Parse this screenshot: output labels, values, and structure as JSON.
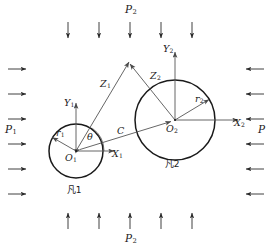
{
  "figure": {
    "type": "engineering-diagram",
    "stroke_color": "#1a1a1a",
    "thin_color": "#555555",
    "background": "#ffffff"
  },
  "loads": {
    "top_label": "P",
    "top_sub": "2",
    "bottom_label": "P",
    "bottom_sub": "2",
    "left_label": "P",
    "left_sub": "1",
    "right_label": "P",
    "right_sub": "",
    "top_arrow_count": 5,
    "bottom_arrow_count": 5,
    "left_arrow_count": 6,
    "right_arrow_count": 6,
    "top_direction": "down",
    "bottom_direction": "up",
    "left_direction": "right",
    "right_direction": "left"
  },
  "body1": {
    "name_label": "凡1",
    "origin_label": "O",
    "origin_sub": "1",
    "x_axis_label": "X",
    "x_axis_sub": "1",
    "y_axis_label": "Y",
    "y_axis_sub": "1",
    "radius_label": "r",
    "radius_sub": "1",
    "vector_label": "Z",
    "vector_sub": "1",
    "angle_label": "θ",
    "center_x": 76,
    "center_y": 151,
    "radius": 27
  },
  "body2": {
    "name_label": "凡2",
    "origin_label": "O",
    "origin_sub": "2",
    "x_axis_label": "X",
    "x_axis_sub": "2",
    "y_axis_label": "Y",
    "y_axis_sub": "2",
    "radius_label": "r",
    "radius_sub": "2",
    "vector_label": "Z",
    "vector_sub": "2",
    "center_x": 175,
    "center_y": 120,
    "radius": 40
  },
  "center_distance": {
    "label": "C",
    "from": "O1",
    "to": "O2"
  }
}
